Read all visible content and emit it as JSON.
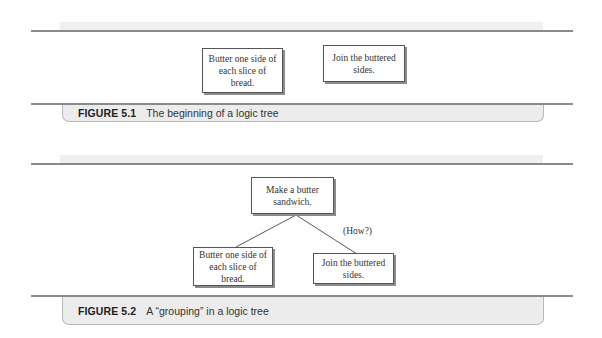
{
  "figures": [
    {
      "number": "FIGURE 5.1",
      "title": "The beginning of a logic tree",
      "nodes": [
        {
          "text": "Butter one side of each slice of bread."
        },
        {
          "text": "Join the buttered sides."
        }
      ]
    },
    {
      "number": "FIGURE 5.2",
      "title": "A “grouping” in a logic tree",
      "root": {
        "text": "Make a butter sandwich."
      },
      "annotation": "(How?)",
      "nodes": [
        {
          "text": "Butter one side of each slice of bread."
        },
        {
          "text": "Join the buttered sides."
        }
      ]
    }
  ],
  "colors": {
    "rule": "#8a8a8a",
    "caption_bg": "#ececec",
    "node_border": "#555555",
    "node_shadow": "#8c8c8c"
  }
}
